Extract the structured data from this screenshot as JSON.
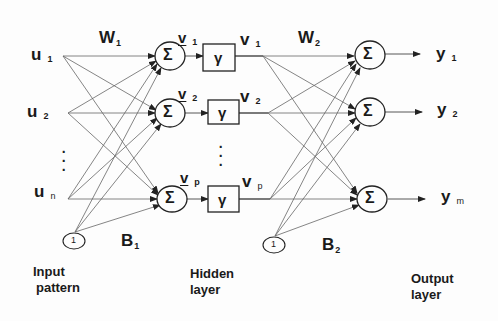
{
  "diagram": {
    "type": "feedforward-neural-network",
    "colors": {
      "ink": "#1a1a1a",
      "lines": "#555555",
      "background": "#fdfdfd"
    },
    "inputs": [
      {
        "name": "u",
        "sub": "1"
      },
      {
        "name": "u",
        "sub": "2"
      },
      {
        "name": "u",
        "sub": "n"
      }
    ],
    "bias_nodes": [
      {
        "label": "1"
      },
      {
        "label": "1"
      }
    ],
    "weights": {
      "w1": {
        "name": "W",
        "sub": "1"
      },
      "w2": {
        "name": "W",
        "sub": "2"
      },
      "b1": {
        "name": "B",
        "sub": "1"
      },
      "b2": {
        "name": "B",
        "sub": "2"
      }
    },
    "hidden": [
      {
        "net": "v",
        "net_sub": "1",
        "act": "v",
        "act_sub": "1"
      },
      {
        "net": "v",
        "net_sub": "2",
        "act": "v",
        "act_sub": "2"
      },
      {
        "net": "v",
        "net_sub": "p",
        "act": "v",
        "act_sub": "p"
      }
    ],
    "sum_symbol": "Σ",
    "activation_symbol": "γ",
    "outputs": [
      {
        "name": "y",
        "sub": "1"
      },
      {
        "name": "y",
        "sub": "2"
      },
      {
        "name": "y",
        "sub": "m"
      }
    ],
    "captions": {
      "input": [
        "Input",
        "pattern"
      ],
      "hidden": [
        "Hidden",
        "layer"
      ],
      "output": [
        "Output",
        "layer"
      ]
    },
    "ellipsis": "⋮"
  }
}
